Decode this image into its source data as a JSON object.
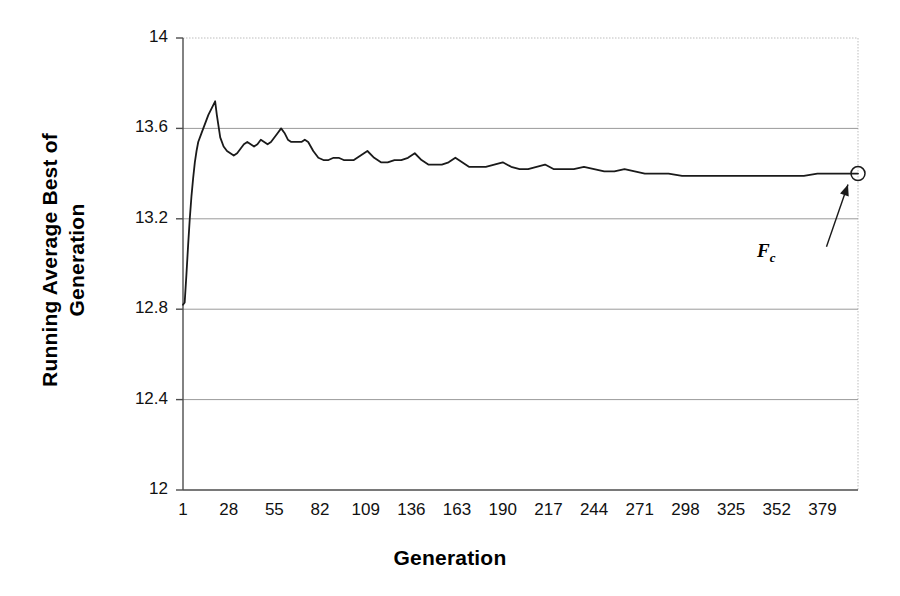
{
  "chart_data": {
    "type": "line",
    "title": "",
    "xlabel": "Generation",
    "ylabel": "Running Average Best of Generation",
    "ylabel_line1": "Running Average Best of",
    "ylabel_line2": "Generation",
    "xlim": [
      1,
      400
    ],
    "ylim": [
      12,
      14
    ],
    "yticks": [
      "12",
      "12.4",
      "12.8",
      "13.2",
      "13.6",
      "14"
    ],
    "ytick_values": [
      12,
      12.4,
      12.8,
      13.2,
      13.6,
      14
    ],
    "xticks": [
      "1",
      "28",
      "55",
      "82",
      "109",
      "136",
      "163",
      "190",
      "217",
      "244",
      "271",
      "298",
      "325",
      "352",
      "379"
    ],
    "xtick_values": [
      1,
      28,
      55,
      82,
      109,
      136,
      163,
      190,
      217,
      244,
      271,
      298,
      325,
      352,
      379
    ],
    "grid": true,
    "grid_axis": "y",
    "legend": "none",
    "line_color": "#1a1a1a",
    "grid_color": "#9a9a9a",
    "axis_color": "#4d4d4d",
    "annotations": [
      {
        "name": "fc-label",
        "text": "F",
        "subscript": "c",
        "x": 379,
        "y": 13.05,
        "points_to_x": 400,
        "points_to_y": 13.4,
        "marker": "circle"
      }
    ],
    "series": [
      {
        "name": "Running Average Best of Generation",
        "x": [
          1,
          2,
          3,
          4,
          5,
          6,
          7,
          8,
          9,
          10,
          12,
          14,
          16,
          18,
          20,
          21,
          23,
          25,
          27,
          29,
          31,
          33,
          35,
          37,
          39,
          41,
          43,
          45,
          47,
          49,
          51,
          53,
          55,
          57,
          59,
          61,
          63,
          65,
          67,
          69,
          71,
          73,
          75,
          78,
          81,
          84,
          87,
          90,
          93,
          96,
          99,
          102,
          106,
          110,
          114,
          118,
          122,
          126,
          130,
          134,
          138,
          142,
          146,
          150,
          154,
          158,
          162,
          166,
          170,
          175,
          180,
          185,
          190,
          195,
          200,
          205,
          210,
          215,
          220,
          226,
          232,
          238,
          244,
          250,
          256,
          262,
          268,
          274,
          280,
          288,
          296,
          304,
          312,
          320,
          328,
          336,
          344,
          352,
          360,
          368,
          376,
          384,
          392,
          400
        ],
        "y": [
          12.82,
          12.83,
          12.95,
          13.08,
          13.2,
          13.3,
          13.38,
          13.45,
          13.5,
          13.54,
          13.58,
          13.62,
          13.66,
          13.69,
          13.72,
          13.66,
          13.56,
          13.52,
          13.5,
          13.49,
          13.48,
          13.49,
          13.51,
          13.53,
          13.54,
          13.53,
          13.52,
          13.53,
          13.55,
          13.54,
          13.53,
          13.54,
          13.56,
          13.58,
          13.6,
          13.58,
          13.55,
          13.54,
          13.54,
          13.54,
          13.54,
          13.55,
          13.54,
          13.5,
          13.47,
          13.46,
          13.46,
          13.47,
          13.47,
          13.46,
          13.46,
          13.46,
          13.48,
          13.5,
          13.47,
          13.45,
          13.45,
          13.46,
          13.46,
          13.47,
          13.49,
          13.46,
          13.44,
          13.44,
          13.44,
          13.45,
          13.47,
          13.45,
          13.43,
          13.43,
          13.43,
          13.44,
          13.45,
          13.43,
          13.42,
          13.42,
          13.43,
          13.44,
          13.42,
          13.42,
          13.42,
          13.43,
          13.42,
          13.41,
          13.41,
          13.42,
          13.41,
          13.4,
          13.4,
          13.4,
          13.39,
          13.39,
          13.39,
          13.39,
          13.39,
          13.39,
          13.39,
          13.39,
          13.39,
          13.39,
          13.4,
          13.4,
          13.4,
          13.4
        ],
        "start_value": 12.82,
        "peak_value": 13.72,
        "peak_x": 20,
        "end_value": 13.4
      }
    ]
  }
}
